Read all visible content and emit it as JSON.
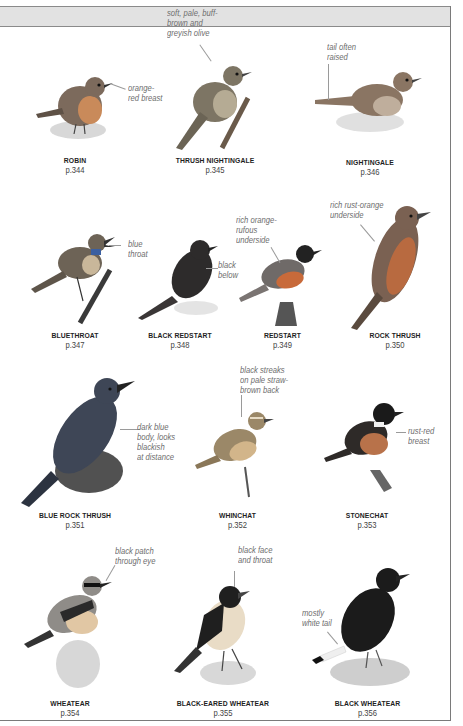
{
  "page": {
    "header_band_color": "#e2e2e2",
    "border_color": "#7a7a7a"
  },
  "birds": [
    {
      "name": "ROBIN",
      "page": "p.344",
      "note": "orange-\nred breast",
      "color": "#7c6a5c",
      "accent": "#c98a5a"
    },
    {
      "name": "THRUSH NIGHTINGALE",
      "page": "p.345",
      "note": "soft, pale, buff-\nbrown and\ngreyish olive",
      "color": "#7d7564",
      "accent": "#b5ab94"
    },
    {
      "name": "NIGHTINGALE",
      "page": "p.346",
      "note": "tail often\nraised",
      "color": "#8a7563",
      "accent": "#bfae9c"
    },
    {
      "name": "BLUETHROAT",
      "page": "p.347",
      "note": "blue\nthroat",
      "color": "#6d6356",
      "accent": "#3b5fa0"
    },
    {
      "name": "BLACK REDSTART",
      "page": "p.348",
      "note": "black\nbelow",
      "color": "#2d2b2b",
      "accent": "#5a5656"
    },
    {
      "name": "REDSTART",
      "page": "p.349",
      "note": "rich orange-\nrufous\nunderside",
      "color": "#6f6a68",
      "accent": "#c86a3a"
    },
    {
      "name": "ROCK THRUSH",
      "page": "p.350",
      "note": "rich rust-orange\nunderside",
      "color": "#7a6152",
      "accent": "#b86a40"
    },
    {
      "name": "BLUE ROCK THRUSH",
      "page": "p.351",
      "note": "dark blue\nbody, looks\nblackish\nat distance",
      "color": "#3e4656",
      "accent": "#2c3340"
    },
    {
      "name": "WHINCHAT",
      "page": "p.352",
      "note": "black streaks\non pale straw-\nbrown back",
      "color": "#9b8868",
      "accent": "#d2b58a"
    },
    {
      "name": "STONECHAT",
      "page": "p.353",
      "note": "rust-red\nbreast",
      "color": "#2e2a28",
      "accent": "#b8724a"
    },
    {
      "name": "WHEATEAR",
      "page": "p.354",
      "note": "black patch\nthrough eye",
      "color": "#8f8c88",
      "accent": "#e1c7a4"
    },
    {
      "name": "BLACK-EARED WHEATEAR",
      "page": "p.355",
      "note": "black face\nand throat",
      "color": "#1f1f1f",
      "accent": "#e9dcc6"
    },
    {
      "name": "BLACK WHEATEAR",
      "page": "p.356",
      "note": "mostly\nwhite tail",
      "color": "#1b1b1b",
      "accent": "#efefef"
    }
  ]
}
